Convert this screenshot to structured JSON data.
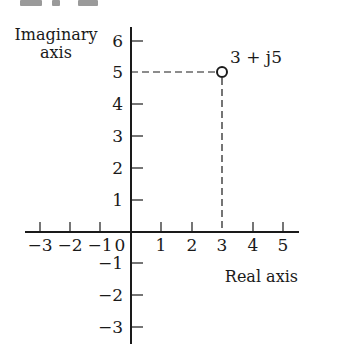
{
  "figure": {
    "header_fragments": [
      "",
      "",
      ""
    ],
    "y_axis_title_line1": "Imaginary",
    "y_axis_title_line2": "axis",
    "x_axis_title": "Real axis",
    "point_label": "3 + j5",
    "x_ticks": [
      {
        "value": -3,
        "label": "−3"
      },
      {
        "value": -2,
        "label": "−2"
      },
      {
        "value": -1,
        "label": "−1"
      },
      {
        "value": 0,
        "label": "0"
      },
      {
        "value": 1,
        "label": "1"
      },
      {
        "value": 2,
        "label": "2"
      },
      {
        "value": 3,
        "label": "3"
      },
      {
        "value": 4,
        "label": "4"
      },
      {
        "value": 5,
        "label": "5"
      }
    ],
    "y_ticks": [
      {
        "value": 6,
        "label": "6"
      },
      {
        "value": 5,
        "label": "5"
      },
      {
        "value": 4,
        "label": "4"
      },
      {
        "value": 3,
        "label": "3"
      },
      {
        "value": 2,
        "label": "2"
      },
      {
        "value": 1,
        "label": "1"
      },
      {
        "value": -1,
        "label": "−1"
      },
      {
        "value": -2,
        "label": "−2"
      },
      {
        "value": -3,
        "label": "−3"
      }
    ],
    "point": {
      "re": 3,
      "im": 5
    },
    "colors": {
      "ink": "#1a1a1a",
      "header_gray": "#9a9a9a",
      "background": "#ffffff"
    }
  }
}
